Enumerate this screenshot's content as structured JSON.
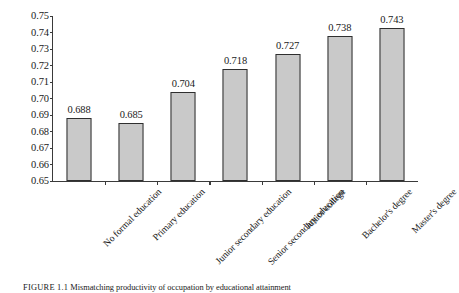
{
  "chart_data": {
    "type": "bar",
    "title": "",
    "subtitle": "",
    "xlabel": "",
    "ylabel": "",
    "ylim": [
      0.65,
      0.75
    ],
    "ytick_step": 0.01,
    "yticks": [
      "0.75",
      "0.74",
      "0.73",
      "0.72",
      "0.71",
      "0.70",
      "0.69",
      "0.68",
      "0.67",
      "0.66",
      "0.65"
    ],
    "ytick_values": [
      0.75,
      0.74,
      0.73,
      0.72,
      0.71,
      0.7,
      0.69,
      0.68,
      0.67,
      0.66,
      0.65
    ],
    "grid": false,
    "legend": null,
    "legend_position": "none",
    "categories": [
      "No formal education",
      "Primary education",
      "Junior secondary education",
      "Senior secondary education",
      "Junior college",
      "Bachelor's degree",
      "Master's degree"
    ],
    "values": [
      0.688,
      0.685,
      0.704,
      0.718,
      0.727,
      0.738,
      0.743
    ],
    "data_labels": [
      "0.688",
      "0.685",
      "0.704",
      "0.718",
      "0.727",
      "0.738",
      "0.743"
    ],
    "bar_fill_color": "#c9c9c9",
    "bar_edge_color": "#2f2f2f",
    "axis_color": "#3a3a3a",
    "background_color": "#ffffff"
  },
  "caption": {
    "tag": "FIGURE 1.1",
    "text": "Mismatching productivity of occupation by educational attainment"
  }
}
